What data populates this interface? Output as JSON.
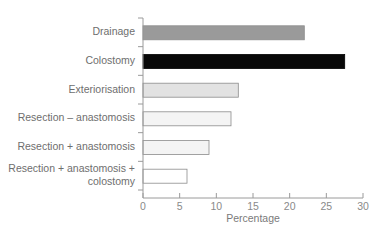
{
  "chart_data": {
    "type": "bar",
    "orientation": "horizontal",
    "title": "",
    "xlabel": "Percentage",
    "ylabel": "",
    "xlim": [
      0,
      30
    ],
    "xticks": [
      "0",
      "5",
      "10",
      "15",
      "20",
      "25",
      "30"
    ],
    "grid": false,
    "legend": null,
    "categories": [
      "Drainage",
      "Colostomy",
      "Exteriorisation",
      "Resection – anastomosis",
      "Resection + anastomosis",
      "Resection + anastomosis + colostomy"
    ],
    "values": [
      22,
      27.5,
      13,
      12,
      9,
      6
    ],
    "bar_fills": [
      "#9a9a9a",
      "#080808",
      "#e2e2e2",
      "#f4f4f4",
      "#f4f4f4",
      "#ffffff"
    ]
  },
  "labels": {
    "cat0": "Drainage",
    "cat1": "Colostomy",
    "cat2": "Exteriorisation",
    "cat3": "Resection – anastomosis",
    "cat4": "Resection + anastomosis",
    "cat5a": "Resection + anastomosis +",
    "cat5b": "colostomy",
    "xlabel": "Percentage",
    "ticks": [
      "0",
      "5",
      "10",
      "15",
      "20",
      "25",
      "30"
    ]
  }
}
